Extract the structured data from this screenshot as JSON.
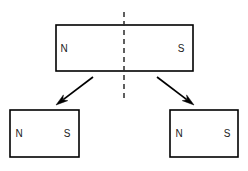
{
  "diagram": {
    "type": "magnet-splitting",
    "canvas": {
      "width": 248,
      "height": 171,
      "background": "#ffffff"
    },
    "stroke_color": "#000000",
    "cut_line_color": "#2b2b2b",
    "label_color": "#1a1a1a",
    "magnets": [
      {
        "id": "original-magnet",
        "name": "original-magnet",
        "x": 56,
        "y": 25,
        "width": 137,
        "height": 46,
        "north_label": "N",
        "south_label": "S",
        "north_x": 64,
        "south_x": 181,
        "label_y": 48
      },
      {
        "id": "left-magnet",
        "name": "left-magnet",
        "x": 10,
        "y": 110,
        "width": 69,
        "height": 47,
        "north_label": "N",
        "south_label": "S",
        "north_x": 19,
        "south_x": 67,
        "label_y": 133
      },
      {
        "id": "right-magnet",
        "name": "right-magnet",
        "x": 170,
        "y": 110,
        "width": 68,
        "height": 47,
        "north_label": "N",
        "south_label": "S",
        "north_x": 179,
        "south_x": 227,
        "label_y": 133
      }
    ],
    "cut_line": {
      "name": "cut-line",
      "x": 124,
      "y_start": 12,
      "y_end": 98,
      "dash_pattern": "5 4"
    },
    "arrows": [
      {
        "id": "arrow-left",
        "name": "arrow-to-left-magnet",
        "x1": 93,
        "y1": 77,
        "x2": 56,
        "y2": 105
      },
      {
        "id": "arrow-right",
        "name": "arrow-to-right-magnet",
        "x1": 157,
        "y1": 77,
        "x2": 194,
        "y2": 105
      }
    ]
  }
}
